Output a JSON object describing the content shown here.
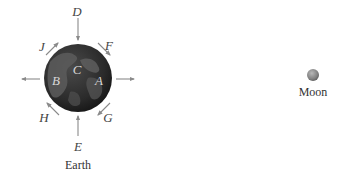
{
  "diagram": {
    "earth": {
      "caption": "Earth",
      "surface_labels": {
        "A": "A",
        "B": "B",
        "C": "C"
      }
    },
    "moon": {
      "caption": "Moon"
    },
    "force_labels": {
      "D": "D",
      "E": "E",
      "F": "F",
      "G": "G",
      "H": "H",
      "J": "J"
    },
    "colors": {
      "earth_dark": "#2a2a2a",
      "earth_land": "#6a6a6a",
      "arrow": "#8a8a8a",
      "moon": "#8c8c8c",
      "text": "#444444"
    }
  }
}
